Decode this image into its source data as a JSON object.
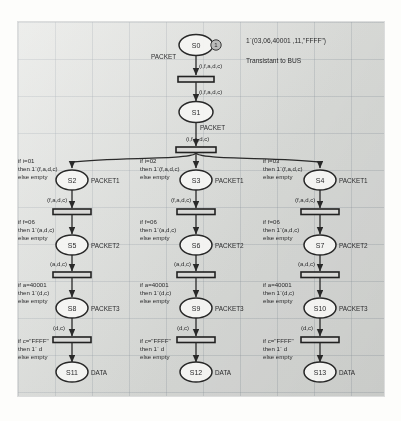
{
  "diagram": {
    "initial_marking": "1`(03,06,40001 ,11,\"FFFF\")",
    "initial_note": "Transistant to BUS",
    "root_place": {
      "id": "S0",
      "label": "S0",
      "port": "PACKET",
      "token": "1"
    },
    "root_arc_in": "(i,f,a,d,c)",
    "root_arc_out": "(i,f,a,d,c)",
    "level1_place": {
      "id": "S1",
      "label": "S1",
      "port": "PACKET",
      "arc": "(i,f,a,d,c)"
    },
    "columns": [
      {
        "guard1": [
          "if i=01",
          "then 1`(f,a,d,c)",
          "else empty"
        ],
        "place1": {
          "label": "S2",
          "port": "PACKET1"
        },
        "arc1": "(f,a,d,c)",
        "guard2": [
          "if f=06",
          "then 1`(a,d,c)",
          "else empty"
        ],
        "place2": {
          "label": "S5",
          "port": "PACKET2"
        },
        "arc2": "(a,d,c)",
        "guard3": [
          "if  a=40001",
          "then 1`(d,c)",
          "else empty"
        ],
        "place3": {
          "label": "S8",
          "port": "PACKET3"
        },
        "arc3": "(d,c)",
        "guard4": [
          "if  c=\"FFFF\"",
          "then 1` d",
          "else empty"
        ],
        "place4": {
          "label": "S11",
          "port": "DATA"
        }
      },
      {
        "guard1": [
          "if i=02",
          "then 1`(f,a,d,c)",
          "else empty"
        ],
        "place1": {
          "label": "S3",
          "port": "PACKET1"
        },
        "arc1": "(f,a,d,c)",
        "guard2": [
          "if f=06",
          "then 1`(a,d,c)",
          "else empty"
        ],
        "place2": {
          "label": "S6",
          "port": "PACKET2"
        },
        "arc2": "(a,d,c)",
        "guard3": [
          "if a=40001",
          "then 1`(d,c)",
          "else empty"
        ],
        "place3": {
          "label": "S9",
          "port": "PACKET3"
        },
        "arc3": "(d,c)",
        "guard4": [
          "if c=\"FFFF\"",
          "then 1` d",
          "else empty"
        ],
        "place4": {
          "label": "S12",
          "port": "DATA"
        }
      },
      {
        "guard1": [
          "if i=03",
          "then 1`(f,a,d,c)",
          "else empty"
        ],
        "place1": {
          "label": "S4",
          "port": "PACKET1"
        },
        "arc1": "(f,a,d,c)",
        "guard2": [
          "if f=06",
          "then 1`(a,d,c)",
          "else empty"
        ],
        "place2": {
          "label": "S7",
          "port": "PACKET2"
        },
        "arc2": "(a,d,c)",
        "guard3": [
          "if a=40001",
          "then 1`(d,c)",
          "else empty"
        ],
        "place3": {
          "label": "S10",
          "port": "PACKET3"
        },
        "arc3": "(d,c)",
        "guard4": [
          "if c=\"FFFF\"",
          "then 1` d",
          "else empty"
        ],
        "place4": {
          "label": "S13",
          "port": "DATA"
        }
      }
    ]
  }
}
